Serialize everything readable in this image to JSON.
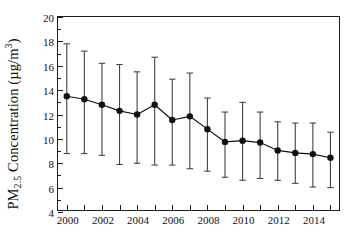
{
  "chart_data": {
    "type": "line",
    "title": "",
    "subtitle": "",
    "xlabel": "",
    "ylabel": "PM2.5 Concentration (µg/m³)",
    "ylabel_parts": {
      "prefix": "PM",
      "subscript": "2.5",
      "middle": " Concentration (µg/m",
      "superscript": "3",
      "suffix": ")"
    },
    "grid": false,
    "legend": "none",
    "error_bars": "vertical whiskers with caps",
    "marker": "filled circle",
    "line_color": "#111111",
    "marker_color": "#111111",
    "error_bar_color": "#444444",
    "frame_color": "#1a1a1a",
    "background": "#ffffff",
    "xlim": [
      1999.5,
      2015.6
    ],
    "ylim": [
      4,
      20
    ],
    "ytick_values": [
      4,
      6,
      8,
      10,
      12,
      14,
      16,
      18,
      20
    ],
    "ytick_labels": [
      "4",
      "6",
      "8",
      "10",
      "12",
      "14",
      "16",
      "18",
      "20"
    ],
    "xtick_values": [
      2000,
      2001,
      2002,
      2003,
      2004,
      2005,
      2006,
      2007,
      2008,
      2009,
      2010,
      2011,
      2012,
      2013,
      2014,
      2015
    ],
    "xtick_labels_shown": [
      "2000",
      "",
      "2002",
      "",
      "2004",
      "",
      "2006",
      "",
      "2008",
      "",
      "2010",
      "",
      "2012",
      "",
      "2014",
      ""
    ],
    "x": [
      2000,
      2001,
      2002,
      2003,
      2004,
      2005,
      2006,
      2007,
      2008,
      2009,
      2010,
      2011,
      2012,
      2013,
      2014,
      2015
    ],
    "categories": [
      "2000",
      "2001",
      "2002",
      "2003",
      "2004",
      "2005",
      "2006",
      "2007",
      "2008",
      "2009",
      "2010",
      "2011",
      "2012",
      "2013",
      "2014",
      "2015"
    ],
    "values": [
      13.5,
      13.25,
      12.8,
      12.3,
      12.0,
      12.8,
      11.55,
      11.85,
      10.8,
      9.75,
      9.85,
      9.7,
      9.05,
      8.85,
      8.75,
      8.45
    ],
    "error_upper": [
      17.8,
      17.2,
      16.2,
      16.1,
      15.5,
      16.7,
      14.9,
      15.4,
      13.35,
      12.2,
      13.0,
      12.2,
      11.4,
      11.3,
      11.3,
      10.55
    ],
    "error_lower": [
      8.8,
      8.8,
      8.65,
      7.9,
      8.0,
      7.85,
      7.85,
      7.55,
      7.35,
      6.85,
      6.6,
      6.75,
      6.6,
      6.35,
      6.05,
      6.0
    ],
    "points": [
      {
        "year": "2000",
        "value": 13.5,
        "upper": 17.8,
        "lower": 8.8
      },
      {
        "year": "2001",
        "value": 13.25,
        "upper": 17.2,
        "lower": 8.8
      },
      {
        "year": "2002",
        "value": 12.8,
        "upper": 16.2,
        "lower": 8.65
      },
      {
        "year": "2003",
        "value": 12.3,
        "upper": 16.1,
        "lower": 7.9
      },
      {
        "year": "2004",
        "value": 12.0,
        "upper": 15.5,
        "lower": 8.0
      },
      {
        "year": "2005",
        "value": 12.8,
        "upper": 16.7,
        "lower": 7.85
      },
      {
        "year": "2006",
        "value": 11.55,
        "upper": 14.9,
        "lower": 7.85
      },
      {
        "year": "2007",
        "value": 11.85,
        "upper": 15.4,
        "lower": 7.55
      },
      {
        "year": "2008",
        "value": 10.8,
        "upper": 13.35,
        "lower": 7.35
      },
      {
        "year": "2009",
        "value": 9.75,
        "upper": 12.2,
        "lower": 6.85
      },
      {
        "year": "2010",
        "value": 9.85,
        "upper": 13.0,
        "lower": 6.6
      },
      {
        "year": "2011",
        "value": 9.7,
        "upper": 12.2,
        "lower": 6.75
      },
      {
        "year": "2012",
        "value": 9.05,
        "upper": 11.4,
        "lower": 6.6
      },
      {
        "year": "2013",
        "value": 8.85,
        "upper": 11.3,
        "lower": 6.35
      },
      {
        "year": "2014",
        "value": 8.75,
        "upper": 11.3,
        "lower": 6.05
      },
      {
        "year": "2015",
        "value": 8.45,
        "upper": 10.55,
        "lower": 6.0
      }
    ]
  }
}
